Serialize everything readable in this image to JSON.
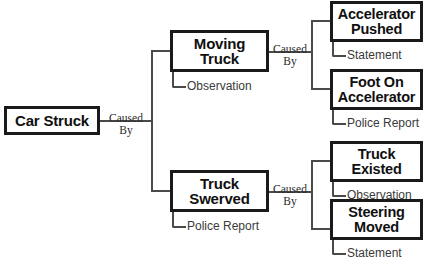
{
  "diagram": {
    "title_visible": false,
    "colors": {
      "box_border": "#1a1a1a",
      "connector": "#4a4a4a",
      "text": "#101010",
      "evidence_text": "#3a3a3a",
      "relation_text": "#2b2b2b",
      "background": "#ffffff"
    },
    "root": {
      "label": "Car Struck",
      "relation_to_children": "Caused\nBy"
    },
    "branches": [
      {
        "id": "moving-truck",
        "label": "Moving\nTruck",
        "evidence": "Observation",
        "relation_to_children": "Caused\nBy",
        "children": [
          {
            "id": "accelerator-pushed",
            "label": "Accelerator\nPushed",
            "evidence": "Statement"
          },
          {
            "id": "foot-on-accelerator",
            "label": "Foot On\nAccelerator",
            "evidence": "Police Report"
          }
        ]
      },
      {
        "id": "truck-swerved",
        "label": "Truck\nSwerved",
        "evidence": "Police Report",
        "relation_to_children": "Caused\nBy",
        "children": [
          {
            "id": "truck-existed",
            "label": "Truck\nExisted",
            "evidence": "Observation"
          },
          {
            "id": "steering-moved",
            "label": "Steering\nMoved",
            "evidence": "Statement"
          }
        ]
      }
    ],
    "clipped_caption_top": "",
    "clipped_caption_bottom": ""
  }
}
